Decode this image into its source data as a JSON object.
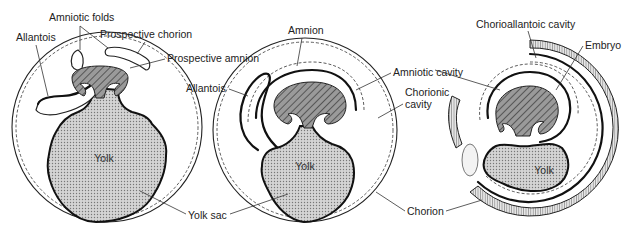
{
  "figure": {
    "type": "diagram",
    "colors": {
      "line": "#222222",
      "yolk_fill": "#c8c8c8",
      "embryo_hatch": "#555555",
      "background": "#ffffff"
    }
  },
  "panels": [
    {
      "id": "stage-1",
      "labels": {
        "amniotic_folds": "Amniotic folds",
        "allantois": "Allantois",
        "prospective_chorion": "Prospective chorion",
        "prospective_amnion": "Prospective amnion",
        "yolk": "Yolk"
      }
    },
    {
      "id": "stage-2",
      "labels": {
        "amnion": "Amnion",
        "allantois": "Allantois",
        "amniotic_cavity": "Amniotic cavity",
        "chorionic_cavity_line1": "Chorionic",
        "chorionic_cavity_line2": "cavity",
        "yolk": "Yolk"
      }
    },
    {
      "id": "stage-3",
      "labels": {
        "chorioallantoic_cavity": "Chorioallantoic cavity",
        "embryo": "Embryo",
        "yolk": "Yolk"
      }
    }
  ],
  "shared_labels": {
    "yolk_sac": "Yolk sac",
    "chorion": "Chorion"
  }
}
